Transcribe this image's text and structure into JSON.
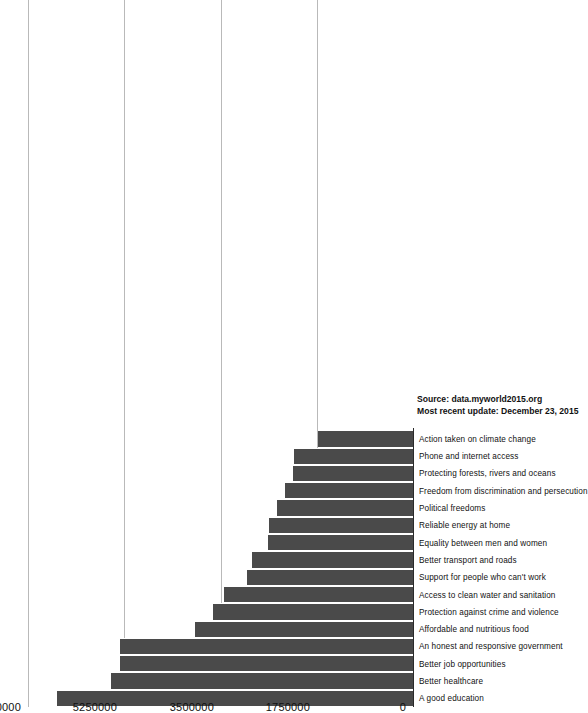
{
  "chart_data": {
    "type": "bar",
    "orientation": "vertical-rotated",
    "title": "",
    "xlabel": "",
    "ylabel": "",
    "ylim": [
      0,
      7000000
    ],
    "grid": true,
    "legend": "none",
    "yticks": [
      "0",
      "1750000",
      "3500000",
      "5250000",
      "7000000"
    ],
    "ytick_values": [
      0,
      1750000,
      3500000,
      5250000,
      7000000
    ],
    "categories": [
      "A good education",
      "Better healthcare",
      "Better job opportunities",
      "An honest and responsive government",
      "Affordable and nutritious food",
      "Protection against crime and violence",
      "Access to clean water and sanitation",
      "Support for people who can't work",
      "Better transport and roads",
      "Equality between men and women",
      "Reliable energy at home",
      "Political freedoms",
      "Freedom from discrimination and persecution",
      "Protecting forests, rivers and oceans",
      "Phone and internet access",
      "Action taken on climate change"
    ],
    "values": [
      6480000,
      5500000,
      5320000,
      5320000,
      3960000,
      3640000,
      3440000,
      3020000,
      2920000,
      2640000,
      2620000,
      2480000,
      2320000,
      2180000,
      2160000,
      1720000
    ],
    "bar_color": "#4a4a4a",
    "gridline_color": "#b9b9b9",
    "axis_color": "#2a2a2a"
  },
  "footer": {
    "source": "Source: data.myworld2015.org",
    "updated": "Most recent update: December 23, 2015"
  }
}
